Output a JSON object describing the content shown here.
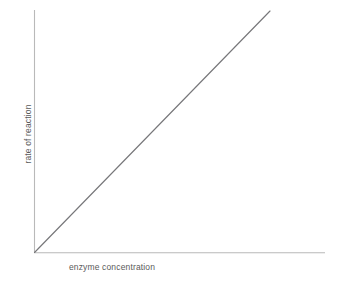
{
  "figure": {
    "background_color": "#ffffff",
    "width": 340,
    "height": 286
  },
  "labels": {
    "x_axis": "enzyme concentration",
    "y_axis": "rate of reaction"
  },
  "style": {
    "axis_color": "#b9b9b9",
    "line_color": "#77777a",
    "text_color": "#5a5a5a"
  },
  "chart_data": {
    "type": "line",
    "title": "",
    "subtitle": "",
    "xlabel": "enzyme concentration",
    "ylabel": "rate of reaction",
    "xlim": [
      0,
      100
    ],
    "ylim": [
      0,
      100
    ],
    "grid": false,
    "legend": false,
    "legend_position": "none",
    "x_ticks": [],
    "y_ticks": [],
    "x_tick_labels": [],
    "y_tick_labels": [],
    "annotations": [],
    "series": [
      {
        "name": "rate of reaction",
        "color": "#77777a",
        "x": [
          0,
          10,
          20,
          30,
          40,
          50,
          60,
          70,
          80,
          90,
          100
        ],
        "values": [
          0,
          10,
          20,
          30,
          40,
          50,
          60,
          70,
          80,
          90,
          100
        ]
      }
    ]
  }
}
